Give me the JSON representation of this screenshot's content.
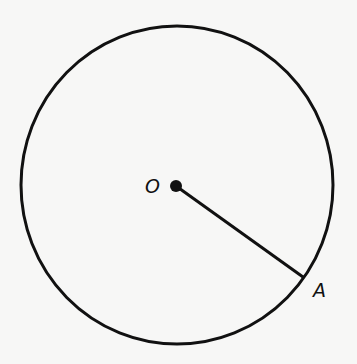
{
  "diagram": {
    "type": "circle-with-radius",
    "circle": {
      "cx": 177,
      "cy": 185,
      "r": 158,
      "stroke": "#111111"
    },
    "center": {
      "label": "O",
      "x": 176,
      "y": 186,
      "label_x": 145,
      "label_y": 193
    },
    "point_a": {
      "label": "A",
      "x": 303,
      "y": 278,
      "label_x": 313,
      "label_y": 297
    },
    "segments": [
      {
        "from": "O",
        "to": "A"
      }
    ]
  }
}
